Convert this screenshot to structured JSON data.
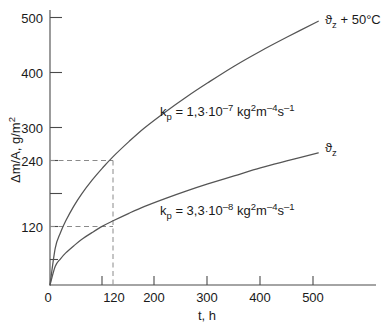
{
  "chart_data": {
    "type": "line",
    "title": "",
    "xlabel": "t, h",
    "ylabel": "Δm/A, g/m²",
    "xlim": [
      0,
      560
    ],
    "ylim": [
      0,
      520
    ],
    "grid": false,
    "legend_position": "inline-right-of-curve",
    "x_ticks_major": [
      0,
      120,
      200,
      300,
      400,
      500
    ],
    "x_tick_labels": [
      "0",
      "120",
      "200",
      "300",
      "400",
      "500"
    ],
    "x_ticks_minor": [
      100
    ],
    "y_ticks_major": [
      120,
      240,
      300,
      400,
      500
    ],
    "y_tick_labels": [
      "120",
      "240",
      "300",
      "400",
      "500"
    ],
    "y_ticks_minor": [
      60,
      180
    ],
    "series": [
      {
        "name": "ϑz + 50°C",
        "label": "ϑ",
        "label_sub": "z",
        "label_suffix": " + 50°C",
        "rate_annotation": "k_p = 1,3·10⁻⁷ kg²m⁻⁴s⁻¹",
        "kp_value": "1,3",
        "kp_exponent": "–7",
        "x": [
          0,
          10,
          20,
          30,
          45,
          60,
          80,
          100,
          120,
          150,
          180,
          220,
          260,
          300,
          350,
          400,
          450,
          510
        ],
        "y": [
          0,
          69,
          98,
          120,
          147,
          170,
          196,
          219,
          240,
          268,
          294,
          324,
          352,
          378,
          409,
          437,
          463,
          493
        ]
      },
      {
        "name": "ϑz",
        "label": "ϑ",
        "label_sub": "z",
        "label_suffix": "",
        "rate_annotation": "k_p = 3,3·10⁻⁸ kg²m⁻⁴s⁻¹",
        "kp_value": "3,3",
        "kp_exponent": "–8",
        "x": [
          0,
          10,
          20,
          30,
          45,
          60,
          80,
          100,
          120,
          150,
          180,
          220,
          260,
          300,
          350,
          400,
          450,
          510
        ],
        "y": [
          0,
          35,
          49,
          60,
          73,
          85,
          98,
          110,
          120,
          134,
          147,
          162,
          176,
          189,
          204,
          219,
          232,
          247
        ]
      }
    ],
    "guide_lines": [
      {
        "type": "horizontal",
        "value": 240,
        "to_x": 120,
        "style": "dashed"
      },
      {
        "type": "horizontal",
        "value": 120,
        "to_x": 120,
        "style": "dashed"
      },
      {
        "type": "vertical",
        "value": 120,
        "to_y": 240,
        "style": "dashed"
      }
    ],
    "colors": {
      "axis": "#4a4a4a",
      "curve": "#555555",
      "guide": "#8a8a8a",
      "text": "#1a1a1a"
    }
  },
  "axes": {
    "x_label": "t, h",
    "y_label_delta": "Δm/A, g/m",
    "y_label_exp": "2"
  },
  "ticks": {
    "y": [
      "500",
      "400",
      "300",
      "240",
      "120"
    ],
    "x": [
      "0",
      "120",
      "200",
      "300",
      "400",
      "500"
    ]
  },
  "annotations": {
    "upper_kp_prefix": "k",
    "upper_kp_sub": "p",
    "upper_kp_eq": " = 1,3",
    "upper_kp_dot": "·",
    "upper_kp_base": "10",
    "upper_kp_exp": "–7",
    "upper_kp_unit_kg": " kg",
    "upper_kp_unit_kg_exp": "2",
    "upper_kp_unit_m": "m",
    "upper_kp_unit_m_exp": "–4",
    "upper_kp_unit_s": "s",
    "upper_kp_unit_s_exp": "–1",
    "lower_kp_eq": " = 3,3",
    "lower_kp_exp": "–8",
    "curve_upper_theta": "ϑ",
    "curve_upper_sub": "z",
    "curve_upper_rest": " + 50°C",
    "curve_lower_theta": "ϑ",
    "curve_lower_sub": "z"
  },
  "caption": {
    "cropped_text": ""
  }
}
